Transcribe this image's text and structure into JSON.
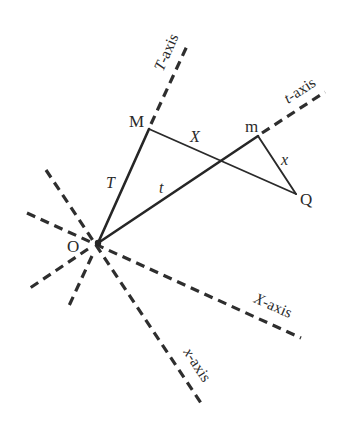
{
  "diagram": {
    "type": "coordinate-axes-geometry",
    "points": {
      "O": {
        "label": "O",
        "x": 98,
        "y": 243
      },
      "M": {
        "label": "M",
        "x": 149,
        "y": 129
      },
      "m": {
        "label": "m",
        "x": 258,
        "y": 136
      },
      "Q": {
        "label": "Q",
        "x": 296,
        "y": 194
      }
    },
    "segments": {
      "T": {
        "label": "T",
        "from": "O",
        "to": "M"
      },
      "t": {
        "label": "t",
        "from": "O",
        "to": "m"
      },
      "X": {
        "label": "X",
        "from": "M",
        "to": "Q"
      },
      "x": {
        "label": "x",
        "from": "m",
        "to": "Q"
      }
    },
    "axes": {
      "T_axis": {
        "name": "T",
        "suffix": "-axis"
      },
      "t_axis": {
        "name": "t",
        "suffix": "-axis"
      },
      "X_axis": {
        "name": "X",
        "suffix": "-axis"
      },
      "x_axis": {
        "name": "x",
        "suffix": "-axis"
      }
    },
    "colors": {
      "line": "#262626",
      "background": "#ffffff"
    }
  }
}
